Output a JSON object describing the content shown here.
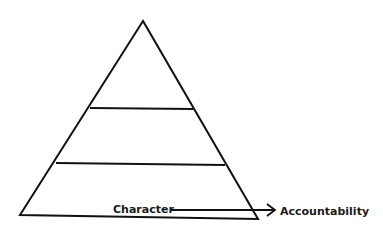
{
  "diagram": {
    "type": "pyramid",
    "levels": 3,
    "stroke_color": "#111111",
    "background": "#ffffff",
    "labels": {
      "source": "Character",
      "target": "Accountability"
    },
    "arrow": {
      "from": "Character",
      "to": "Accountability",
      "direction": "right"
    }
  }
}
